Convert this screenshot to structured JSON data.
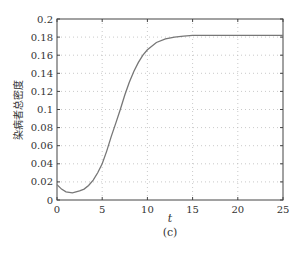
{
  "chart_data": {
    "type": "line",
    "title": "",
    "caption": "(c)",
    "xlabel": "t",
    "ylabel": "染病者总密度",
    "xlim": [
      0,
      25
    ],
    "ylim": [
      0,
      0.2
    ],
    "xticks": [
      "0",
      "5",
      "10",
      "15",
      "20",
      "25"
    ],
    "yticks": [
      "0",
      "0.02",
      "0.04",
      "0.06",
      "0.08",
      "0.1",
      "0.12",
      "0.14",
      "0.16",
      "0.18",
      "0.2"
    ],
    "grid": true,
    "legend": null,
    "series": [
      {
        "name": "total infected density",
        "color": "#777777",
        "x": [
          0,
          0.5,
          1,
          1.7,
          2.5,
          3,
          3.5,
          4,
          4.5,
          5,
          5.5,
          6,
          6.5,
          7,
          7.5,
          8,
          8.5,
          9,
          9.5,
          10,
          11,
          12,
          13,
          14,
          15,
          16,
          18,
          20,
          25
        ],
        "y": [
          0.017,
          0.012,
          0.009,
          0.008,
          0.01,
          0.012,
          0.016,
          0.022,
          0.03,
          0.04,
          0.054,
          0.07,
          0.085,
          0.1,
          0.116,
          0.13,
          0.142,
          0.152,
          0.16,
          0.166,
          0.174,
          0.178,
          0.18,
          0.181,
          0.182,
          0.182,
          0.182,
          0.182,
          0.182
        ]
      }
    ]
  }
}
